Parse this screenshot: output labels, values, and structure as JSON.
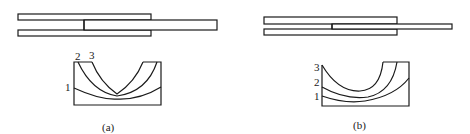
{
  "figure": {
    "panels": [
      {
        "id": "a",
        "caption": "(a)",
        "layer_labels": [
          "1",
          "2",
          "3"
        ]
      },
      {
        "id": "b",
        "caption": "(b)",
        "layer_labels": [
          "1",
          "2",
          "3"
        ]
      }
    ]
  },
  "colors": {
    "line": "#1a1a1a",
    "background": "#ffffff"
  }
}
